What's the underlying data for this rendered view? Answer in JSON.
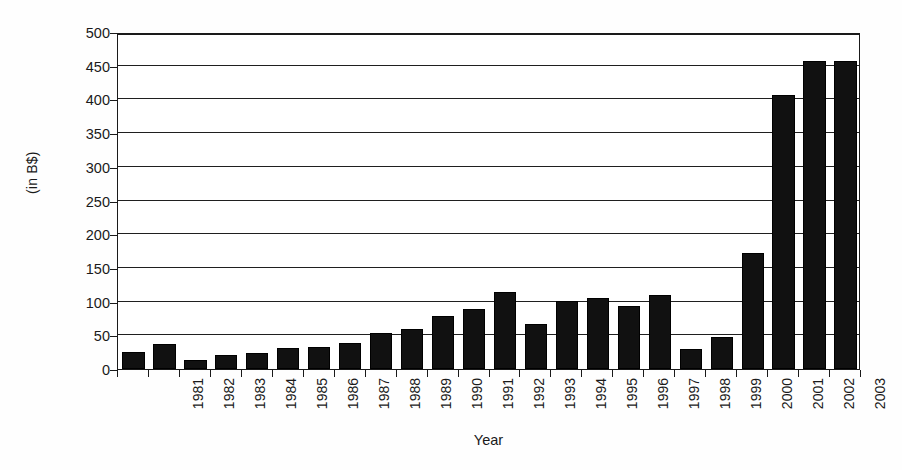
{
  "chart_data": {
    "type": "bar",
    "title": "",
    "xlabel": "Year",
    "ylabel": "(in B$)",
    "categories": [
      "1981",
      "1982",
      "1983",
      "1984",
      "1985",
      "1986",
      "1987",
      "1988",
      "1989",
      "1990",
      "1991",
      "1992",
      "1993",
      "1994",
      "1995",
      "1996",
      "1997",
      "1998",
      "1999",
      "2000",
      "2001",
      "2002",
      "2003",
      "2004"
    ],
    "values": [
      25,
      37,
      14,
      21,
      24,
      31,
      32,
      38,
      54,
      59,
      78,
      89,
      115,
      67,
      101,
      106,
      94,
      110,
      30,
      47,
      172,
      407,
      457,
      457
    ],
    "series": [
      {
        "name": "Value (in B$)",
        "values": [
          25,
          37,
          14,
          21,
          24,
          31,
          32,
          38,
          54,
          59,
          78,
          89,
          115,
          67,
          101,
          106,
          94,
          110,
          30,
          47,
          172,
          407,
          457,
          457
        ]
      }
    ],
    "ylim": [
      0,
      500
    ],
    "ytick_labels": [
      "0",
      "50",
      "100",
      "150",
      "200",
      "250",
      "300",
      "350",
      "400",
      "450",
      "500"
    ],
    "ytick_values": [
      0,
      50,
      100,
      150,
      200,
      250,
      300,
      350,
      400,
      450,
      500
    ],
    "grid": "horizontal",
    "legend": "none",
    "bar_color": "#111111",
    "axis_color": "#1a1a1a",
    "background_color": "#ffffff"
  }
}
